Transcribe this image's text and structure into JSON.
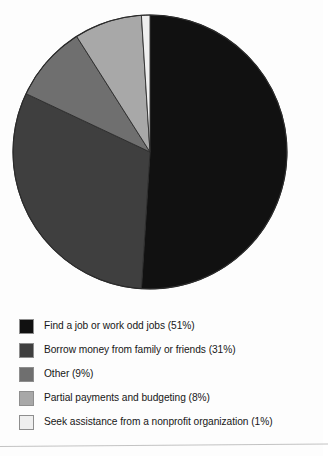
{
  "chart_data": {
    "type": "pie",
    "title": "",
    "subtitle": "",
    "xlabel": "",
    "ylabel": "",
    "legend_position": "bottom-left",
    "grid": false,
    "start_angle_deg": 0,
    "direction": "clockwise",
    "categories": [
      "Find a job or work odd jobs",
      "Borrow money from family or friends",
      "Other",
      "Partial payments and budgeting",
      "Seek assistance from a nonprofit organization"
    ],
    "values": [
      51,
      31,
      9,
      8,
      1
    ],
    "value_unit": "%",
    "colors": [
      "#111111",
      "#3f3f3f",
      "#6f6f6f",
      "#a8a8a8",
      "#efefef"
    ],
    "slices": [
      {
        "label": "Find a job or work odd jobs",
        "value": 51,
        "color": "#111111"
      },
      {
        "label": "Borrow money from family or friends",
        "value": 31,
        "color": "#3f3f3f"
      },
      {
        "label": "Other",
        "value": 9,
        "color": "#6f6f6f"
      },
      {
        "label": "Partial payments and budgeting",
        "value": 8,
        "color": "#a8a8a8"
      },
      {
        "label": "Seek assistance from a nonprofit organization",
        "value": 1,
        "color": "#efefef"
      }
    ]
  },
  "pie": {
    "center_x": 150,
    "center_y": 152,
    "radius": 137,
    "outline_color": "#2b2b2b"
  },
  "legend": {
    "items": [
      {
        "swatch_color": "#111111",
        "label": "Find a job or work odd jobs (51%)"
      },
      {
        "swatch_color": "#3f3f3f",
        "label": "Borrow money from family or friends (31%)"
      },
      {
        "swatch_color": "#6f6f6f",
        "label": "Other (9%)"
      },
      {
        "swatch_color": "#a8a8a8",
        "label": "Partial payments and budgeting (8%)"
      },
      {
        "swatch_color": "#efefef",
        "label": "Seek assistance from a nonprofit organization (1%)"
      }
    ]
  }
}
